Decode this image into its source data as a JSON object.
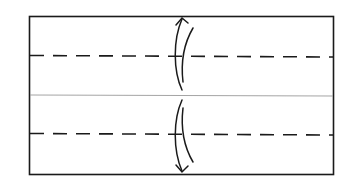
{
  "diagram": {
    "type": "origami-fold-diagram",
    "description": "Rectangle with center crease; fold top and bottom edges to the center along two valley-fold (dashed) lines",
    "colors": {
      "outline": "#1a1a1a",
      "crease": "#9a9a9a",
      "fold_line": "#1a1a1a",
      "arrow": "#1a1a1a",
      "background": "#ffffff"
    },
    "paper": {
      "x": 29,
      "y": 16,
      "width": 304,
      "height": 158
    },
    "center_crease": {
      "y": 95
    },
    "valley_folds": [
      {
        "name": "upper-valley-fold",
        "y": 56
      },
      {
        "name": "lower-valley-fold",
        "y": 134
      }
    ],
    "arrows": [
      {
        "name": "upper-fold-arrow",
        "direction": "up-and-back",
        "x": 182
      },
      {
        "name": "lower-fold-arrow",
        "direction": "down-and-back",
        "x": 182
      }
    ]
  }
}
